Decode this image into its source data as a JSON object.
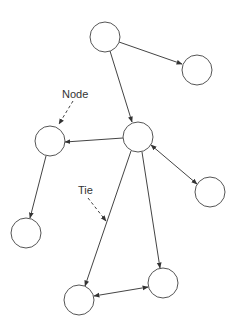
{
  "diagram": {
    "type": "network-graph",
    "labels": {
      "node_label": "Node",
      "tie_label": "Tie"
    },
    "colors": {
      "stroke": "#444444",
      "node_fill": "#ffffff",
      "background": "#ffffff"
    },
    "nodes": [
      {
        "id": "A",
        "cx": 105,
        "cy": 37,
        "r": 15
      },
      {
        "id": "B",
        "cx": 197,
        "cy": 70,
        "r": 15
      },
      {
        "id": "C",
        "cx": 138,
        "cy": 137,
        "r": 15
      },
      {
        "id": "D",
        "cx": 50,
        "cy": 141,
        "r": 15
      },
      {
        "id": "E",
        "cx": 210,
        "cy": 192,
        "r": 15
      },
      {
        "id": "F",
        "cx": 26,
        "cy": 233,
        "r": 15
      },
      {
        "id": "G",
        "cx": 163,
        "cy": 283,
        "r": 15
      },
      {
        "id": "H",
        "cx": 79,
        "cy": 300,
        "r": 15
      }
    ],
    "edges": [
      {
        "from": "A",
        "to": "B",
        "direction": "forward"
      },
      {
        "from": "A",
        "to": "C",
        "direction": "forward"
      },
      {
        "from": "C",
        "to": "D",
        "direction": "forward"
      },
      {
        "from": "C",
        "to": "E",
        "direction": "both"
      },
      {
        "from": "D",
        "to": "F",
        "direction": "forward"
      },
      {
        "from": "C",
        "to": "H",
        "direction": "forward"
      },
      {
        "from": "C",
        "to": "G",
        "direction": "forward"
      },
      {
        "from": "H",
        "to": "G",
        "direction": "both"
      }
    ],
    "annotations": [
      {
        "text": "Node",
        "points_to": "D"
      },
      {
        "text": "Tie",
        "points_to": "edge C-H"
      }
    ]
  }
}
